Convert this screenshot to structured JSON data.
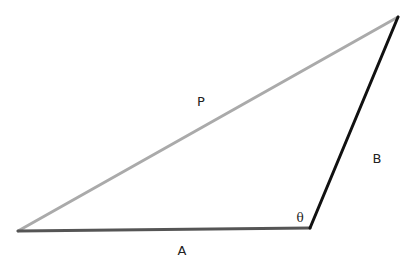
{
  "diagram": {
    "type": "triangle",
    "width": 419,
    "height": 265,
    "background": "#ffffff",
    "vertices": {
      "left": {
        "x": 18,
        "y": 231
      },
      "bottom_right": {
        "x": 310,
        "y": 228
      },
      "top": {
        "x": 398,
        "y": 17
      }
    },
    "sides": [
      {
        "id": "P",
        "label": "P",
        "from": "left",
        "to": "top",
        "color": "#aaaaaa",
        "stroke_width": 3,
        "label_x": 201,
        "label_y": 106
      },
      {
        "id": "A",
        "label": "A",
        "from": "left",
        "to": "bottom_right",
        "color": "#555555",
        "stroke_width": 3,
        "label_x": 182,
        "label_y": 255
      },
      {
        "id": "B",
        "label": "B",
        "from": "bottom_right",
        "to": "top",
        "color": "#111111",
        "stroke_width": 3,
        "label_x": 377,
        "label_y": 163
      }
    ],
    "angle": {
      "label": "θ",
      "vertex": "bottom_right",
      "label_x": 300,
      "label_y": 222
    }
  }
}
